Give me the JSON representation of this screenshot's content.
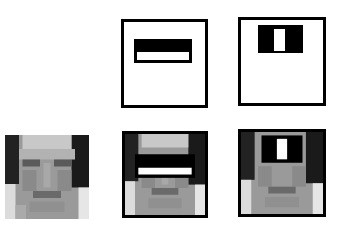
{
  "figure": {
    "colors": {
      "background": "#ffffff",
      "frame": "#000000",
      "feature_dark": "#000000",
      "feature_light": "#ffffff"
    },
    "top_row": [
      {
        "id": "edge-feature-kernel",
        "type": "horizontal two-rectangle (edge) feature",
        "dark": "top",
        "light": "bottom"
      },
      {
        "id": "line-feature-kernel",
        "type": "vertical three-rectangle (line) feature",
        "dark": "sides",
        "light": "center"
      }
    ],
    "bottom_row": [
      {
        "id": "face-original",
        "description": "grayscale face image"
      },
      {
        "id": "face-edge-feature",
        "description": "face with edge feature overlaid across eyes"
      },
      {
        "id": "face-line-feature",
        "description": "face with line feature overlaid across eyes and nose bridge"
      }
    ]
  }
}
